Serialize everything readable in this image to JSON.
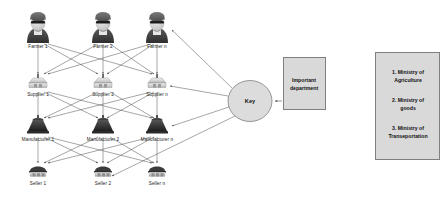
{
  "diagram": {
    "colors": {
      "edge": "#4d4d4d",
      "node_fill_light": "#d9d9d9",
      "node_fill_dark": "#404040",
      "box_fill": "#d9d9d9",
      "box_border": "#808080",
      "text": "#111111",
      "background": "#ffffff"
    },
    "layers": [
      {
        "id": "farmers",
        "icon": "farmer-person-icon",
        "nodes": [
          {
            "label": "Farmer 1"
          },
          {
            "label": "Farmer 2"
          },
          {
            "label": "Farmer n"
          }
        ]
      },
      {
        "id": "suppliers",
        "icon": "supplier-silo-icon",
        "nodes": [
          {
            "label": "Supplier 1"
          },
          {
            "label": "Supplier 2"
          },
          {
            "label": "Supplier n"
          }
        ]
      },
      {
        "id": "manufacturers",
        "icon": "manufacturer-factory-icon",
        "nodes": [
          {
            "label": "Manufacturer 1"
          },
          {
            "label": "Manufacturer 2"
          },
          {
            "label": "Manufacturer n"
          }
        ]
      },
      {
        "id": "sellers",
        "icon": "seller-stall-icon",
        "nodes": [
          {
            "label": "Seller 1"
          },
          {
            "label": "Seller 2"
          },
          {
            "label": "Seller n"
          }
        ]
      }
    ],
    "key_node": {
      "label": "Key"
    },
    "department_box": {
      "line1": "Important",
      "line2": "department"
    },
    "legend_box": {
      "items": [
        {
          "line1": "1. Ministry of",
          "line2": "Agriculture"
        },
        {
          "line1": "2. Ministry of",
          "line2": "goods"
        },
        {
          "line1": "3. Ministry of",
          "line2": "Transeportation"
        }
      ]
    }
  }
}
